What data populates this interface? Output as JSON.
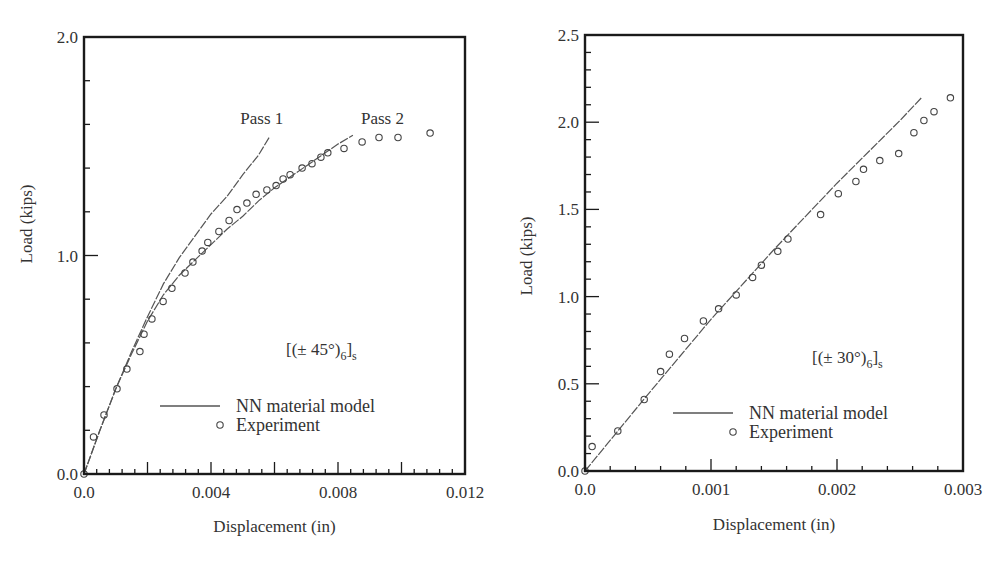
{
  "chart_data": [
    {
      "type": "line",
      "title": "",
      "annotation": {
        "prefix": "[(± 45°)",
        "sub1": "6",
        "mid": "]",
        "sub2": "s"
      },
      "xlabel": "Displacement (in)",
      "ylabel": "Load (kips)",
      "xlim": [
        0,
        0.012
      ],
      "ylim": [
        0,
        2.0
      ],
      "x_ticks": [
        0.0,
        0.004,
        0.008,
        0.012
      ],
      "x_tick_labels": [
        "0.0",
        "0.004",
        "0.008",
        "0.012"
      ],
      "x_minor_step": 0.0004,
      "x_major_step": 0.002,
      "y_ticks": [
        0.0,
        1.0,
        2.0
      ],
      "y_tick_labels": [
        "0.0",
        "1.0",
        "2.0"
      ],
      "y_minor_step": 0.2,
      "grid": false,
      "legend": {
        "position": "lower-center",
        "entries": [
          {
            "label": "NN material model",
            "marker": "line"
          },
          {
            "label": "Experiment",
            "marker": "circle"
          }
        ]
      },
      "line_labels": [
        {
          "text": "Pass 1",
          "x": 0.0056,
          "y": 1.6
        },
        {
          "text": "Pass 2",
          "x": 0.0094,
          "y": 1.6
        }
      ],
      "series": [
        {
          "name": "NN material model (Pass 1)",
          "kind": "line",
          "x": [
            0.0,
            0.0005,
            0.001,
            0.0015,
            0.002,
            0.0025,
            0.003,
            0.0035,
            0.004,
            0.0045,
            0.005,
            0.0055,
            0.00583
          ],
          "y": [
            0.0,
            0.2,
            0.39,
            0.56,
            0.72,
            0.87,
            0.99,
            1.09,
            1.19,
            1.27,
            1.37,
            1.46,
            1.54
          ]
        },
        {
          "name": "NN material model (Pass 2)",
          "kind": "line",
          "x": [
            0.0,
            0.0005,
            0.001,
            0.0015,
            0.002,
            0.0025,
            0.003,
            0.0035,
            0.004,
            0.0045,
            0.005,
            0.0055,
            0.006,
            0.0065,
            0.007,
            0.0075,
            0.008,
            0.00847
          ],
          "y": [
            0.0,
            0.2,
            0.39,
            0.55,
            0.7,
            0.82,
            0.91,
            0.98,
            1.05,
            1.12,
            1.18,
            1.25,
            1.31,
            1.36,
            1.41,
            1.46,
            1.51,
            1.55
          ]
        },
        {
          "name": "Experiment",
          "kind": "scatter",
          "x": [
            0.0,
            0.0003,
            0.00063,
            0.00104,
            0.00135,
            0.00176,
            0.00189,
            0.00214,
            0.00249,
            0.00277,
            0.00318,
            0.00343,
            0.00372,
            0.0039,
            0.00425,
            0.00457,
            0.00482,
            0.00513,
            0.00542,
            0.00576,
            0.00605,
            0.00627,
            0.00649,
            0.00687,
            0.00718,
            0.00746,
            0.00768,
            0.00819,
            0.00876,
            0.00929,
            0.00989,
            0.0109
          ],
          "y": [
            0.0,
            0.17,
            0.27,
            0.39,
            0.48,
            0.56,
            0.64,
            0.71,
            0.79,
            0.85,
            0.92,
            0.97,
            1.02,
            1.06,
            1.11,
            1.16,
            1.21,
            1.24,
            1.28,
            1.3,
            1.32,
            1.35,
            1.37,
            1.4,
            1.42,
            1.45,
            1.47,
            1.49,
            1.52,
            1.54,
            1.54,
            1.56
          ]
        }
      ]
    },
    {
      "type": "line",
      "title": "",
      "annotation": {
        "prefix": "[(± 30°)",
        "sub1": "6",
        "mid": "]",
        "sub2": "s"
      },
      "xlabel": "Displacement (in)",
      "ylabel": "Load (kips)",
      "xlim": [
        0,
        0.003
      ],
      "ylim": [
        0,
        2.5
      ],
      "x_ticks": [
        0.0,
        0.001,
        0.002,
        0.003
      ],
      "x_tick_labels": [
        "0.0",
        "0.001",
        "0.002",
        "0.003"
      ],
      "x_minor_step": 0.0002,
      "x_major_step": 0.001,
      "y_ticks": [
        0.0,
        0.5,
        1.0,
        1.5,
        2.0,
        2.5
      ],
      "y_tick_labels": [
        "0.0",
        "0.5",
        "1.0",
        "1.5",
        "2.0",
        "2.5"
      ],
      "y_minor_step": 0.1,
      "grid": false,
      "legend": {
        "position": "lower-center",
        "entries": [
          {
            "label": "NN material model",
            "marker": "line"
          },
          {
            "label": "Experiment",
            "marker": "circle"
          }
        ]
      },
      "line_labels": [],
      "series": [
        {
          "name": "NN material model",
          "kind": "line",
          "x": [
            0.0,
            0.0005,
            0.001,
            0.0015,
            0.002,
            0.0025,
            0.00267
          ],
          "y": [
            0.0,
            0.44,
            0.87,
            1.27,
            1.65,
            2.01,
            2.14
          ]
        },
        {
          "name": "Experiment",
          "kind": "scatter",
          "x": [
            0.0,
            5.6e-05,
            0.00026,
            0.00047,
            0.0006,
            0.00067,
            0.00079,
            0.00094,
            0.00106,
            0.0012,
            0.00133,
            0.0014,
            0.00153,
            0.00161,
            0.00187,
            0.00201,
            0.00215,
            0.00221,
            0.00234,
            0.00249,
            0.00261,
            0.00269,
            0.00277,
            0.0029
          ],
          "y": [
            0.0,
            0.14,
            0.23,
            0.41,
            0.57,
            0.67,
            0.76,
            0.86,
            0.93,
            1.01,
            1.11,
            1.18,
            1.26,
            1.33,
            1.47,
            1.59,
            1.66,
            1.73,
            1.78,
            1.82,
            1.94,
            2.01,
            2.06,
            2.14
          ]
        }
      ]
    }
  ],
  "layout_px": [
    {
      "left": 84,
      "right": 465,
      "top": 37,
      "bottom": 474,
      "legend_x": 160,
      "legend_y": 406,
      "annot_x": 286,
      "annot_y": 355,
      "ylabel_x": 32,
      "ylabel_y": 224,
      "xlabel_y": 532
    },
    {
      "left": 585,
      "right": 963,
      "top": 35,
      "bottom": 471,
      "legend_x": 673,
      "legend_y": 413,
      "annot_x": 812,
      "annot_y": 363,
      "ylabel_x": 532,
      "ylabel_y": 256,
      "xlabel_y": 530
    }
  ],
  "colors": {
    "axis": "#1a1a1a",
    "line": "#555555",
    "marker": "#444444",
    "text": "#333333"
  }
}
